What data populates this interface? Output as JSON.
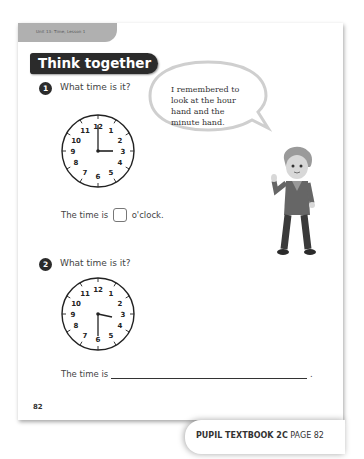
{
  "header": {
    "unit_label": "Unit 13: Time, Lesson 1",
    "section_title": "Think together"
  },
  "questions": [
    {
      "number": "1",
      "prompt": "What time is it?",
      "clock": {
        "hour_hand": "3",
        "minute_hand": "12",
        "shown_time": "3 o'clock"
      },
      "answer_prefix": "The time is",
      "answer_suffix": "o'clock."
    },
    {
      "number": "2",
      "prompt": "What time is it?",
      "clock": {
        "hour_hand": "between 2 and 3",
        "minute_hand": "6",
        "shown_time": "half past 2"
      },
      "answer_prefix": "The time is",
      "answer_suffix": "."
    }
  ],
  "clock_numbers": [
    "12",
    "1",
    "2",
    "3",
    "4",
    "5",
    "6",
    "7",
    "8",
    "9",
    "10",
    "11"
  ],
  "speech_bubble": {
    "lines": [
      "I remembered to",
      "look at the hour",
      "hand and the",
      "minute hand."
    ]
  },
  "page_number": "82",
  "footer": {
    "book": "PUPIL TEXTBOOK 2C",
    "page": "PAGE 82"
  }
}
